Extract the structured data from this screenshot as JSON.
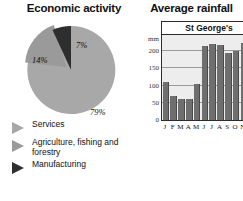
{
  "left_panel": {
    "title": "Economic activity",
    "legend": [
      {
        "label": "Services",
        "color": "#a8a8a8",
        "icon": "triangle-right-icon"
      },
      {
        "label": "Agriculture, fishing and forestry",
        "color": "#9a9a9a",
        "icon": "triangle-right-icon"
      },
      {
        "label": "Manufacturing",
        "color": "#2e2e2e",
        "icon": "triangle-right-icon"
      }
    ]
  },
  "right_panel": {
    "title": "Average rainfall",
    "station": "St George's"
  },
  "chart_data": [
    {
      "type": "pie",
      "title": "Economic activity",
      "categories": [
        "Services",
        "Agriculture, fishing and forestry",
        "Manufacturing"
      ],
      "values": [
        79,
        14,
        7
      ],
      "labels": [
        "79%",
        "14%",
        "7%"
      ],
      "colors": [
        "#a8a8a8",
        "#9a9a9a",
        "#2e2e2e"
      ],
      "unit": "percent",
      "legend_position": "bottom-left",
      "notes": "14% slice is slightly separated (exploded) from the pie"
    },
    {
      "type": "bar",
      "title": "Average rainfall",
      "subtitle": "St George's",
      "categories": [
        "J",
        "F",
        "M",
        "A",
        "M",
        "J",
        "J",
        "A",
        "S",
        "O",
        "N",
        "D"
      ],
      "values": [
        110,
        70,
        62,
        60,
        105,
        215,
        220,
        218,
        195,
        200,
        225,
        180
      ],
      "xlabel": "",
      "ylabel": "mm",
      "ylim": [
        0,
        250
      ],
      "yticks": [
        0,
        50,
        100,
        150,
        200
      ],
      "ytick_labels": [
        "0",
        "50",
        "100",
        "150",
        "200"
      ],
      "grid": true,
      "bar_color": "#6f6f6f",
      "plot_background": "#ededed"
    }
  ]
}
